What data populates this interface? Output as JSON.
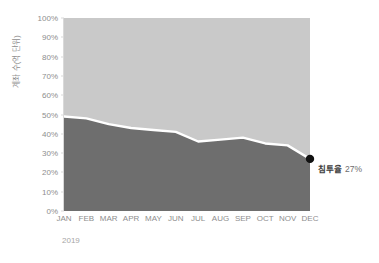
{
  "top_fragment": "",
  "annotation": {
    "marker": "endpoint-dot",
    "label": "침투율",
    "value": "27%"
  },
  "axis": {
    "year": "2019"
  },
  "chart_data": {
    "type": "area",
    "title": "",
    "subtitle": "",
    "xlabel": "2019",
    "ylabel": "계좌 수(억 단위)",
    "categories": [
      "JAN",
      "FEB",
      "MAR",
      "APR",
      "MAY",
      "JUN",
      "JUL",
      "AUG",
      "SEP",
      "OCT",
      "NOV",
      "DEC"
    ],
    "ylim": [
      0,
      100
    ],
    "ytick_labels": [
      "0%",
      "10%",
      "20%",
      "30%",
      "40%",
      "50%",
      "60%",
      "70%",
      "80%",
      "90%",
      "100%"
    ],
    "ytick_values": [
      0,
      10,
      20,
      30,
      40,
      50,
      60,
      70,
      80,
      90,
      100
    ],
    "grid": false,
    "stacked_percent": true,
    "legend": "none",
    "series": [
      {
        "name": "침투율",
        "color": "#6e6e6e",
        "values": [
          49,
          48,
          45,
          43,
          42,
          41,
          36,
          37,
          38,
          35,
          34,
          27
        ]
      },
      {
        "name": "remainder",
        "color": "#c9c9c9",
        "values": [
          51,
          52,
          55,
          57,
          58,
          59,
          64,
          63,
          62,
          65,
          66,
          73
        ]
      }
    ],
    "boundary_line_color": "#ffffff",
    "endpoint": {
      "category": "DEC",
      "value": 27,
      "marker_color": "#111111"
    }
  },
  "colors": {
    "lower_area": "#6e6e6e",
    "upper_area": "#c9c9c9",
    "divider_line": "#ffffff",
    "axis": "#d9d9d9",
    "tick_text": "#8e8e8e",
    "annotation_text": "#3d3d3d"
  }
}
